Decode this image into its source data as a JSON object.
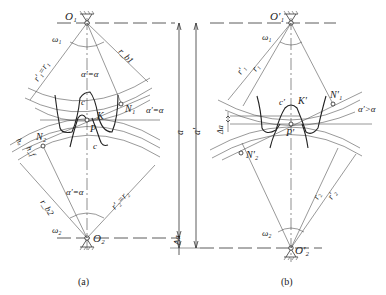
{
  "figure": {
    "panels": [
      {
        "id": "a",
        "caption": "(a)",
        "labels": {
          "O1": "O₁",
          "O2": "O₂",
          "omega1": "ω₁",
          "omega2": "ω₂",
          "r1_eq": "r′₁=r₁",
          "r2_eq": "r′₂=r₂",
          "rb1": "r_b1",
          "rb2": "r_b2",
          "alpha_top": "α′=α",
          "alpha_right": "α′=α",
          "alpha_bottom": "α′=α",
          "c_top": "c",
          "c_bottom": "c",
          "K": "K",
          "P": "P",
          "N1": "N₁",
          "N2": "N₂",
          "ha": "hₐ",
          "hf": "h_f"
        }
      },
      {
        "id": "b",
        "caption": "(b)",
        "labels": {
          "O1p": "O′₁",
          "O2p": "O′₂",
          "omega1": "ω₁",
          "omega2": "ω₂",
          "r1p": "r′₁",
          "r1": "r₁",
          "r2": "r₂",
          "r2p": "r′₂",
          "alpha_gt": "α′>α",
          "c_prime": "c′",
          "K_prime": "K′",
          "P_prime": "P′",
          "N1p": "N′₁",
          "N2p": "N′₂",
          "delta_a": "Δa"
        }
      }
    ],
    "dimensions": {
      "a": "a",
      "a_prime": "a′",
      "delta_a": "Δa"
    }
  }
}
